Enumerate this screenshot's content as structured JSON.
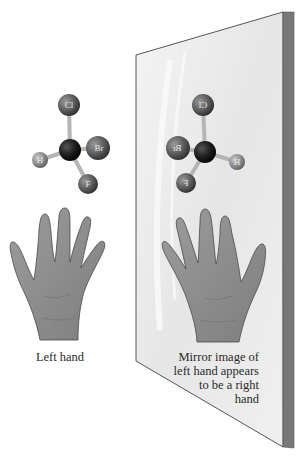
{
  "figure": {
    "left_panel": {
      "molecule": {
        "center_atom": "C",
        "atoms": [
          {
            "id": "Cl",
            "label": "Cl"
          },
          {
            "id": "Br",
            "label": "Br"
          },
          {
            "id": "H",
            "label": "H"
          },
          {
            "id": "F",
            "label": "F"
          }
        ]
      },
      "caption": "Left hand"
    },
    "mirror_panel": {
      "molecule": {
        "center_atom": "C",
        "atoms": [
          {
            "id": "Cl",
            "label": "Cl",
            "mirrored": true
          },
          {
            "id": "Br",
            "label": "Br",
            "mirrored": true
          },
          {
            "id": "H",
            "label": "H",
            "mirrored": true
          },
          {
            "id": "F",
            "label": "F",
            "mirrored": true
          }
        ]
      },
      "caption_lines": [
        "Mirror image of",
        "left hand appears",
        "to be a right",
        "hand"
      ]
    }
  },
  "colors": {
    "background": "#ffffff",
    "mirror_face": "#ececec",
    "mirror_edge": "#777777",
    "mirror_outline": "#555555",
    "atom_halogen": "#6a6a6a",
    "atom_carbon": "#1c1c1c",
    "atom_hydrogen": "#9a9a9a",
    "bond": "#b5b5b5",
    "hand_fill": "#8e8e8e",
    "hand_outline": "#4a4a4a",
    "text": "#2a2a2a"
  }
}
